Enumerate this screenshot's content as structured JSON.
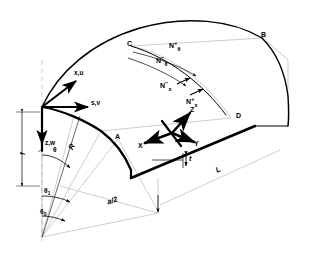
{
  "figure": {
    "type": "engineering-diagram",
    "background_color": "#ffffff",
    "line_color": "#000000",
    "thin_line_color": "#9a9a9a"
  },
  "points": [
    {
      "id": "A",
      "label": "A",
      "x": 118,
      "y": 139
    },
    {
      "id": "B",
      "label": "B",
      "x": 263,
      "y": 38
    },
    {
      "id": "C",
      "label": "C",
      "x": 131,
      "y": 46
    },
    {
      "id": "D",
      "label": "D",
      "x": 239,
      "y": 118
    }
  ],
  "axes": {
    "local": [
      {
        "id": "xu",
        "label": "x,u"
      },
      {
        "id": "sv",
        "label": "s,v"
      },
      {
        "id": "zw",
        "label": "z,w"
      }
    ],
    "global": [
      {
        "id": "X",
        "label": "X"
      },
      {
        "id": "Y",
        "label": "Y"
      },
      {
        "id": "Z",
        "label": "Z"
      }
    ]
  },
  "dimensions": [
    {
      "id": "f",
      "label": "f",
      "description": "rise-height"
    },
    {
      "id": "R",
      "label": "R",
      "description": "radius-of-curvature"
    },
    {
      "id": "t",
      "label": "t",
      "description": "shell-thickness"
    },
    {
      "id": "L",
      "label": "L",
      "description": "shell-length"
    },
    {
      "id": "a2",
      "label": "a/2",
      "description": "half-chord-width"
    }
  ],
  "angles": [
    {
      "id": "theta",
      "label": "θ"
    },
    {
      "id": "theta1",
      "label": "θ",
      "sub": "1"
    },
    {
      "id": "theta0",
      "label": "θ",
      "sub": "0"
    }
  ],
  "forces": [
    {
      "id": "Nth_plus",
      "base": "N",
      "sup": "+",
      "sub": "θ"
    },
    {
      "id": "Nth_minus",
      "base": "N",
      "sup": "−",
      "sub": "θ"
    },
    {
      "id": "Nx_minus",
      "base": "N",
      "sup": "−",
      "sub": "x"
    },
    {
      "id": "Nx_plus",
      "base": "N",
      "sup": "+",
      "sub": "x"
    }
  ]
}
